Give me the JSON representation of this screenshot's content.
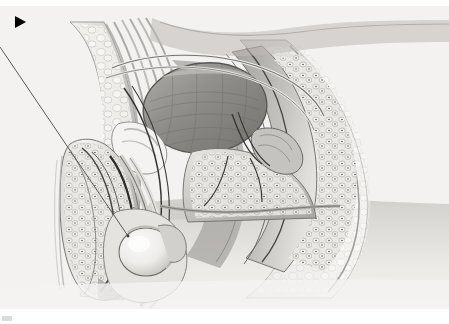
{
  "figure": {
    "kind": "medical-illustration",
    "view": "sagittal section",
    "subject": "male pelvis",
    "rendering": "grayscale airbrush / stipple medical art",
    "canvas": {
      "width": 449,
      "height": 324,
      "background": "#ffffff"
    },
    "plate": {
      "x": 0,
      "y": 6,
      "width": 449,
      "height": 303,
      "background": "#f4f4f3",
      "paper_tint": "#f0efee"
    }
  },
  "annotations": {
    "marker": {
      "name": "black-triangle-marker",
      "shape": "right-pointing solid triangle",
      "color": "#000000",
      "x": 15,
      "y": 16,
      "width": 11,
      "height": 12
    },
    "leader_line": {
      "name": "leader-line",
      "color": "#4a4a4a",
      "width": 0.9,
      "start": {
        "x": 0,
        "y": 47
      },
      "end": {
        "x": 128,
        "y": 236
      },
      "points_at": "testis / epididymis in scrotum"
    },
    "corner_mark": {
      "name": "page-corner-mark",
      "color": "#dcdcdc",
      "x": 2,
      "y": 316,
      "width": 10,
      "height": 5
    }
  },
  "palette": {
    "paper": "#f4f4f3",
    "paper_shadow": "#eceae8",
    "tissue_light": "#f7f6f4",
    "tissue_mid": "#cfcdc9",
    "tissue_dark": "#9a9894",
    "bladder_fill": "#8e8d89",
    "bladder_dark": "#6f6e6a",
    "outline": "#3a3a38",
    "ink": "#000000",
    "body_gradient_top": "#d8d6d3",
    "body_gradient_bottom": "#f2f1ef"
  },
  "structures": [
    {
      "id": "abdominal-wall",
      "label": "anterior abdominal wall",
      "region": "upper-left",
      "tone": "#dedcd8"
    },
    {
      "id": "rectus-muscle",
      "label": "rectus abdominis muscle striations",
      "region": "upper-left-center",
      "tone": "#bdbbb7"
    },
    {
      "id": "bladder",
      "label": "urinary bladder",
      "region": "center-upper",
      "tone": "#8e8d89"
    },
    {
      "id": "pubic-bone",
      "label": "pubic symphysis",
      "region": "center-left",
      "tone": "#efeeec"
    },
    {
      "id": "prostate",
      "label": "prostate gland",
      "region": "center",
      "tone": "#c8c6c2"
    },
    {
      "id": "seminal-vesicle",
      "label": "seminal vesicle",
      "region": "center-right",
      "tone": "#b5b3af"
    },
    {
      "id": "rectum",
      "label": "rectum",
      "region": "right-center",
      "tone": "#a9a7a3"
    },
    {
      "id": "anal-canal",
      "label": "anal canal",
      "region": "right-lower",
      "tone": "#9d9b97"
    },
    {
      "id": "gluteal-mass",
      "label": "gluteal soft tissue",
      "region": "right",
      "tone": "#e6e4e1"
    },
    {
      "id": "penis-shaft",
      "label": "penis shaft (corpora)",
      "region": "left-lower",
      "tone": "#ebe9e6"
    },
    {
      "id": "urethra",
      "label": "urethra",
      "region": "left-lower-center",
      "tone": "#2f2f2d"
    },
    {
      "id": "scrotum-testis",
      "label": "testis within scrotum",
      "region": "lower-center-left",
      "tone": "#f3f1ee"
    },
    {
      "id": "epididymis",
      "label": "epididymis",
      "region": "lower-center-left",
      "tone": "#d4d2ce"
    },
    {
      "id": "spermatic-cord",
      "label": "spermatic cord / vas deferens",
      "region": "center-left",
      "tone": "#4a4a48"
    },
    {
      "id": "thigh-body",
      "label": "thigh / lower body mass",
      "region": "bottom",
      "tone": "#dedcd9"
    }
  ]
}
